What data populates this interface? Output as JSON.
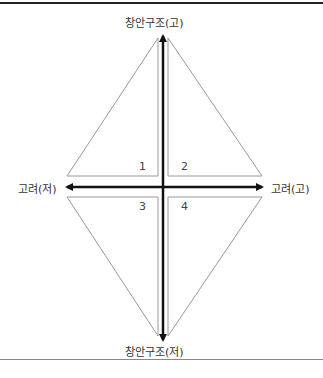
{
  "diagram": {
    "axes": {
      "vertical_top_label": "창안구조(고)",
      "vertical_bottom_label": "창안구조(저)",
      "horizontal_left_label": "고려(저)",
      "horizontal_right_label": "고려(고)"
    },
    "quadrants": [
      {
        "id": "1",
        "label": "1"
      },
      {
        "id": "2",
        "label": "2"
      },
      {
        "id": "3",
        "label": "3"
      },
      {
        "id": "4",
        "label": "4"
      }
    ],
    "colors": {
      "axis": "#111111",
      "triangle_outline": "#999999",
      "text": "#333333"
    }
  }
}
